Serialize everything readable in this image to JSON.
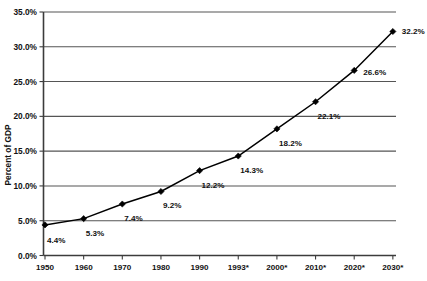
{
  "chart_data": {
    "type": "line",
    "title": "",
    "xlabel": "",
    "ylabel": "Percent of GDP",
    "categories": [
      "1950",
      "1960",
      "1970",
      "1980",
      "1990",
      "1993*",
      "2000*",
      "2010*",
      "2020*",
      "2030*"
    ],
    "values": [
      4.4,
      5.3,
      7.4,
      9.2,
      12.2,
      14.3,
      18.2,
      22.1,
      26.6,
      32.2
    ],
    "point_labels": [
      "4.4%",
      "5.3%",
      "7.4%",
      "9.2%",
      "12.2%",
      "14.3%",
      "18.2%",
      "22.1%",
      "26.6%",
      "32.2%"
    ],
    "ylim": [
      0,
      35
    ],
    "ytick_values": [
      0,
      5,
      10,
      15,
      20,
      25,
      30,
      35
    ],
    "ytick_labels": [
      "0.0%",
      "5.0%",
      "10.0%",
      "15.0%",
      "20.0%",
      "25.0%",
      "30.0%",
      "35.0%"
    ],
    "grid": true,
    "grid_axis": "y",
    "legend": false,
    "legend_position": "none",
    "marker": "diamond",
    "series_color": "#000000",
    "grid_color": "#555555",
    "axis_color": "#3c3c3c",
    "background_color": "#ffffff"
  },
  "labels": {
    "y_axis_title": "Percent of GDP"
  }
}
